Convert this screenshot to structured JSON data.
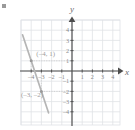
{
  "figure": {
    "kind": "coordinate-grid-plot",
    "x_axis_label": "x",
    "y_axis_label": "y",
    "corner_mark": "bullet-mark"
  },
  "chart_data": {
    "type": "line",
    "title": "",
    "xlabel": "x",
    "ylabel": "y",
    "xlim": [
      -5,
      4.8
    ],
    "ylim": [
      -5.2,
      5.2
    ],
    "grid": true,
    "legend": "none",
    "x_ticks": [
      -4,
      -3,
      -2,
      -1,
      1,
      2,
      3,
      4
    ],
    "y_ticks": [
      4,
      3,
      2,
      1,
      -1,
      -2,
      -3,
      -4
    ],
    "x_tick_labels": [
      "-4",
      "-3",
      "-2",
      "-1",
      "1",
      "2",
      "3",
      "4"
    ],
    "y_tick_labels": [
      "4",
      "3",
      "2",
      "1",
      "-1",
      "-2",
      "-3",
      "-4"
    ],
    "series": [
      {
        "name": "line",
        "slope": -3,
        "intercept": -11,
        "x": [
          -4.85,
          -2.3
        ],
        "y": [
          3.55,
          -4.1
        ],
        "color": "#b5b5b5"
      }
    ],
    "points": [
      {
        "name": "point-a",
        "x": -4,
        "y": 1,
        "label": "(–4, 1)",
        "label_x": -3.5,
        "label_y": 1.45
      },
      {
        "name": "point-b",
        "x": -3,
        "y": -2,
        "label": "(–3, –2)",
        "label_x": -5.0,
        "label_y": -2.55
      }
    ],
    "guides": [
      {
        "name": "guide-a-horizontal",
        "from": [
          -4,
          1
        ],
        "to": [
          0,
          1
        ]
      },
      {
        "name": "guide-a-vertical",
        "from": [
          -4,
          1
        ],
        "to": [
          -4,
          0
        ]
      },
      {
        "name": "guide-b-horizontal",
        "from": [
          -3,
          -2
        ],
        "to": [
          0,
          -2
        ]
      },
      {
        "name": "guide-b-vertical",
        "from": [
          -3,
          -2
        ],
        "to": [
          -3,
          0
        ]
      }
    ],
    "colors": {
      "grid": "#dfe2e6",
      "axis": "#4c4c4c",
      "line": "#b5b5b5",
      "label": "#9d9d9d",
      "tick": "#8a8a8a"
    }
  }
}
